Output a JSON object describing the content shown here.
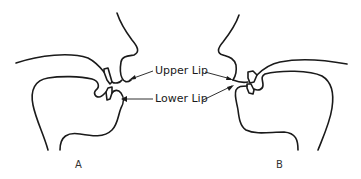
{
  "diagram": {
    "labels": {
      "upper_lip": "Upper Lip",
      "lower_lip": "Lower Lip"
    },
    "figures": [
      {
        "id": "A",
        "caption": "A",
        "facing": "right",
        "description": "Lips apart, upper and lower teeth separated"
      },
      {
        "id": "B",
        "caption": "B",
        "facing": "left",
        "description": "Lips closed together, teeth nearly touching"
      }
    ],
    "colors": {
      "line": "#1a1a1a",
      "background": "#ffffff"
    }
  }
}
